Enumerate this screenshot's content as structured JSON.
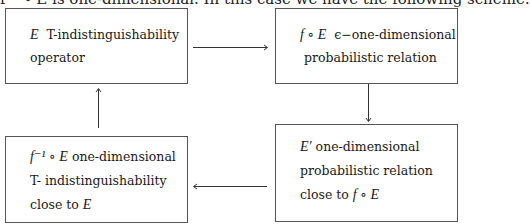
{
  "caption": "f⁻¹ ∘ E is one-dimensional. In this case we have the following scheme:",
  "boxes": {
    "top_left": {
      "lines": [
        "E  T-indistinguishability",
        "operator"
      ],
      "math_prefix": "E",
      "line1_rest": "T-indistinguishability",
      "line2": "operator"
    },
    "top_right": {
      "math_prefix": "f ∘ E",
      "line1_rest": "ϵ−one-dimensional",
      "line2": "probabilistic relation"
    },
    "bottom_right": {
      "math_prefix": "E′",
      "line1_rest": "one-dimensional",
      "line2": "probabilistic relation",
      "line3_text": "close to",
      "line3_math": "f ∘ E"
    },
    "bottom_left": {
      "math_prefix": "f⁻¹ ∘ E",
      "line1_rest": "one-dimensional",
      "line2": "T- indistinguishability",
      "line3_text": "close to",
      "line3_math": "E"
    }
  },
  "arrows": [
    {
      "from": "top_left",
      "to": "top_right",
      "direction": "right"
    },
    {
      "from": "top_right",
      "to": "bottom_right",
      "direction": "down"
    },
    {
      "from": "bottom_right",
      "to": "bottom_left",
      "direction": "left"
    },
    {
      "from": "bottom_left",
      "to": "top_left",
      "direction": "up"
    }
  ]
}
